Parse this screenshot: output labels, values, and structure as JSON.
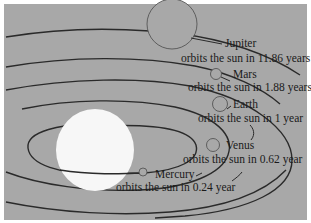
{
  "diagram": {
    "background_color": "#a8a8a8",
    "orbit_color": "#2a2a2a",
    "sun_color": "#f7f7f7",
    "planets": [
      {
        "name": "Jupiter",
        "period_text": "orbits the sun in 11.86 years",
        "period_years": 11.86
      },
      {
        "name": "Mars",
        "period_text": "orbits the sun in 1.88 years",
        "period_years": 1.88
      },
      {
        "name": "Earth",
        "period_text": "orbits the sun in 1 year",
        "period_years": 1
      },
      {
        "name": "Venus",
        "period_text": "orbits the sun in 0.62 year",
        "period_years": 0.62
      },
      {
        "name": "Mercury",
        "period_text": "orbits the sun in 0.24 year",
        "period_years": 0.24
      }
    ]
  }
}
